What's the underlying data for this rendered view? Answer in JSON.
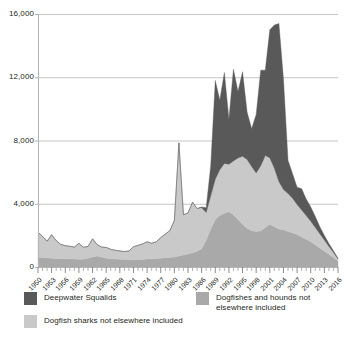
{
  "chart_data": {
    "type": "area",
    "stacked": true,
    "title": "",
    "subtitle": "",
    "xlabel": "",
    "ylabel": "",
    "grid": true,
    "legend_position": "bottom",
    "ylim": [
      0,
      16000
    ],
    "yticks": [
      0,
      4000,
      8000,
      12000,
      16000
    ],
    "ytick_labels": [
      "0",
      "4,000",
      "8,000",
      "12,000",
      "16,000"
    ],
    "xlim": [
      1950,
      2016
    ],
    "x": [
      1950,
      1951,
      1952,
      1953,
      1954,
      1955,
      1956,
      1957,
      1958,
      1959,
      1960,
      1961,
      1962,
      1963,
      1964,
      1965,
      1966,
      1967,
      1968,
      1969,
      1970,
      1971,
      1972,
      1973,
      1974,
      1975,
      1976,
      1977,
      1978,
      1979,
      1980,
      1981,
      1982,
      1983,
      1984,
      1985,
      1986,
      1987,
      1988,
      1989,
      1990,
      1991,
      1992,
      1993,
      1994,
      1995,
      1996,
      1997,
      1998,
      1999,
      2000,
      2001,
      2002,
      2003,
      2004,
      2005,
      2006,
      2007,
      2008,
      2009,
      2010,
      2011,
      2012,
      2013,
      2014,
      2015,
      2016
    ],
    "xtick_labels": [
      "1950",
      "1953",
      "1956",
      "1959",
      "1962",
      "1965",
      "1968",
      "1971",
      "1974",
      "1977",
      "1980",
      "1983",
      "1986",
      "1989",
      "1992",
      "1995",
      "1998",
      "2001",
      "2004",
      "2007",
      "2010",
      "2013",
      "2016"
    ],
    "xtick_interval": 3,
    "series": [
      {
        "name": "Dogfishes and hounds not elsewhere included",
        "color": "#a9a9a9",
        "order": 1,
        "values": [
          620,
          600,
          580,
          560,
          540,
          530,
          520,
          510,
          500,
          495,
          490,
          560,
          640,
          700,
          640,
          560,
          520,
          500,
          490,
          480,
          470,
          460,
          470,
          480,
          500,
          520,
          540,
          560,
          580,
          600,
          640,
          700,
          760,
          820,
          900,
          1000,
          1150,
          1700,
          2400,
          3000,
          3250,
          3400,
          3500,
          3300,
          3000,
          2700,
          2450,
          2300,
          2250,
          2300,
          2500,
          2700,
          2550,
          2400,
          2350,
          2250,
          2150,
          2050,
          1900,
          1750,
          1600,
          1400,
          1200,
          1000,
          800,
          600,
          380
        ]
      },
      {
        "name": "Dogfish sharks not elsewhere included",
        "color": "#c9c9c9",
        "order": 2,
        "values": [
          1580,
          1340,
          1050,
          1480,
          1130,
          900,
          830,
          800,
          760,
          1000,
          760,
          740,
          1140,
          720,
          620,
          680,
          600,
          560,
          520,
          500,
          540,
          820,
          900,
          980,
          1100,
          980,
          1050,
          1300,
          1500,
          1700,
          2300,
          7150,
          2550,
          2600,
          3200,
          2700,
          2600,
          1750,
          2100,
          2550,
          2900,
          3150,
          3000,
          3400,
          3900,
          4300,
          4350,
          4050,
          3700,
          4100,
          4550,
          4200,
          3700,
          3000,
          2550,
          2400,
          2200,
          1900,
          1700,
          1500,
          1300,
          1100,
          900,
          700,
          500,
          320,
          120
        ]
      },
      {
        "name": "Deepwater Squalids",
        "color": "#595959",
        "order": 3,
        "values": [
          0,
          0,
          0,
          0,
          0,
          0,
          0,
          0,
          0,
          0,
          0,
          0,
          0,
          0,
          0,
          0,
          0,
          0,
          0,
          0,
          0,
          0,
          0,
          0,
          0,
          0,
          0,
          0,
          0,
          0,
          0,
          0,
          0,
          0,
          0,
          0,
          50,
          300,
          1900,
          6250,
          4400,
          5750,
          2850,
          5800,
          4200,
          5350,
          3000,
          2400,
          3700,
          6050,
          5400,
          8100,
          9050,
          10000,
          7000,
          2100,
          1550,
          1100,
          1350,
          1050,
          900,
          700,
          450,
          300,
          180,
          100,
          50
        ]
      }
    ],
    "peaks": {
      "total_max": 15400,
      "total_max_year": 2003,
      "early_spike": 7900,
      "early_spike_year": 1981
    }
  },
  "legend": {
    "items": [
      {
        "label": "Deepwater Squalids",
        "color": "#595959"
      },
      {
        "label": "Dogfish sharks not elsewhere included",
        "color": "#c9c9c9"
      },
      {
        "label": "Dogfishes and hounds not elsewhere included",
        "color": "#a9a9a9"
      }
    ]
  },
  "axis": {
    "axis_color": "#b5b5b5",
    "grid_color": "#c4c4c4",
    "text_color": "#231f20"
  }
}
